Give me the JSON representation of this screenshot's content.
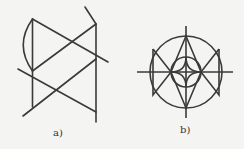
{
  "figures": [
    {
      "id": "a",
      "label": "a)",
      "description": "Line construction with arc"
    },
    {
      "id": "b",
      "label": "b)",
      "description": "Circular ornament with crossing axes, inner circle, and W/M zigzag"
    }
  ],
  "colors": {
    "stroke": "#3a3a3a",
    "background": "#f4f4f2"
  }
}
